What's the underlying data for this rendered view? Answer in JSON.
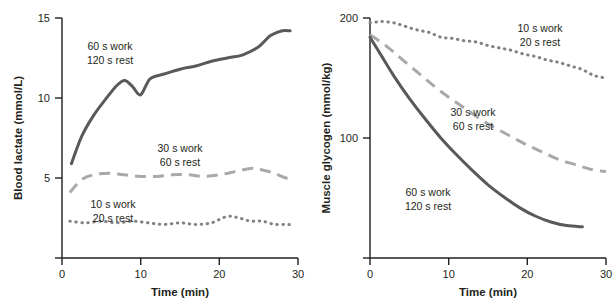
{
  "chart_data": [
    {
      "type": "line",
      "panel": "left",
      "title": "",
      "xlabel": "Time (min)",
      "ylabel": "Blood lactate (mmol/L)",
      "xlim": [
        0,
        30
      ],
      "ylim": [
        0,
        15
      ],
      "xticks": [
        0,
        10,
        20,
        30
      ],
      "yticks": [
        5,
        10,
        15
      ],
      "xticklabels": [
        "0",
        "10",
        "20",
        "30"
      ],
      "yticklabels": [
        "5",
        "10",
        "15"
      ],
      "grid": false,
      "legend_position": "inline-annotations",
      "annotations": [
        {
          "text_line1": "60 s work",
          "text_line2": "120 s rest",
          "x": 6.2,
          "y": 12.9
        },
        {
          "text_line1": "30 s work",
          "text_line2": "60 s rest",
          "x": 15.0,
          "y": 6.6
        },
        {
          "text_line1": "10 s work",
          "text_line2": "20 s rest",
          "x": 6.2,
          "y": 3.5
        }
      ],
      "series": [
        {
          "name": "60 s work / 120 s rest",
          "style": "solid",
          "color": "#58595b",
          "x": [
            1.2,
            2.5,
            4.0,
            5.5,
            7.0,
            8.0,
            9.0,
            10.0,
            11.2,
            13.0,
            15.0,
            17.0,
            19.0,
            21.0,
            23.0,
            25.0,
            26.5,
            28.0,
            29.0
          ],
          "y": [
            5.9,
            7.6,
            8.9,
            9.9,
            10.8,
            11.1,
            10.7,
            10.2,
            11.2,
            11.5,
            11.8,
            12.0,
            12.3,
            12.5,
            12.7,
            13.2,
            13.9,
            14.2,
            14.2
          ]
        },
        {
          "name": "30 s work / 60 s rest",
          "style": "dashed",
          "color": "#a7a9ac",
          "x": [
            1.0,
            2.5,
            4.0,
            6.0,
            8.0,
            10.0,
            12.0,
            14.0,
            16.0,
            18.0,
            20.0,
            22.0,
            24.0,
            25.5,
            27.0,
            28.5,
            29.5
          ],
          "y": [
            4.1,
            4.9,
            5.2,
            5.3,
            5.2,
            5.1,
            5.1,
            5.2,
            5.2,
            5.1,
            5.2,
            5.4,
            5.6,
            5.5,
            5.3,
            5.0,
            5.0
          ]
        },
        {
          "name": "10 s work / 20 s rest",
          "style": "dotted",
          "color": "#808285",
          "x": [
            1.0,
            3.0,
            5.0,
            7.0,
            9.0,
            11.0,
            13.0,
            15.0,
            17.0,
            19.0,
            21.0,
            22.5,
            24.0,
            25.5,
            27.0,
            28.5,
            29.5
          ],
          "y": [
            2.3,
            2.2,
            2.3,
            2.2,
            2.3,
            2.2,
            2.1,
            2.2,
            2.1,
            2.2,
            2.6,
            2.5,
            2.3,
            2.3,
            2.1,
            2.1,
            2.1
          ]
        }
      ]
    },
    {
      "type": "line",
      "panel": "right",
      "title": "",
      "xlabel": "Time (min)",
      "ylabel": "Muscle glycogen (mmol/kg)",
      "xlim": [
        0,
        30
      ],
      "ylim": [
        0,
        200
      ],
      "xticks": [
        0,
        10,
        20,
        30
      ],
      "yticks": [
        100,
        200
      ],
      "xticklabels": [
        "0",
        "10",
        "20",
        "30"
      ],
      "yticklabels": [
        "100",
        "200"
      ],
      "grid": false,
      "legend_position": "inline-annotations",
      "annotations": [
        {
          "text_line1": "10 s work",
          "text_line2": "20 s rest",
          "x": 19.5,
          "y": 186
        },
        {
          "text_line1": "30 s work",
          "text_line2": "60 s rest",
          "x": 11.0,
          "y": 126
        },
        {
          "text_line1": "60 s work",
          "text_line2": "120 s rest",
          "x": 6.0,
          "y": 58
        }
      ],
      "series": [
        {
          "name": "10 s work / 20 s rest",
          "style": "dotted",
          "color": "#808285",
          "x": [
            0,
            1.5,
            3.0,
            4.5,
            6.0,
            7.5,
            9.0,
            10.5,
            12.0,
            13.5,
            15.0,
            16.5,
            18.0,
            19.5,
            21.0,
            22.5,
            24.0,
            25.5,
            27.0,
            28.5,
            30.0
          ],
          "y": [
            196,
            197,
            196,
            193,
            190,
            188,
            184,
            183,
            181,
            180,
            177,
            175,
            173,
            170,
            168,
            165,
            163,
            160,
            157,
            152,
            150
          ]
        },
        {
          "name": "30 s work / 60 s rest",
          "style": "dashed",
          "color": "#a7a9ac",
          "x": [
            0,
            2,
            4,
            6,
            8,
            10,
            12,
            14,
            16,
            18,
            20,
            22,
            24,
            26,
            28,
            30
          ],
          "y": [
            186,
            177,
            166,
            155,
            144,
            134,
            125,
            116,
            108,
            101,
            94,
            88,
            82,
            78,
            74,
            72
          ]
        },
        {
          "name": "60 s work / 120 s rest",
          "style": "solid",
          "color": "#58595b",
          "x": [
            0,
            1.5,
            3,
            5,
            7,
            9,
            11,
            13,
            15,
            17,
            19,
            21,
            23,
            25,
            27
          ],
          "y": [
            184,
            168,
            152,
            133,
            116,
            100,
            86,
            73,
            61,
            51,
            42,
            35,
            30,
            27,
            26
          ]
        }
      ]
    }
  ]
}
